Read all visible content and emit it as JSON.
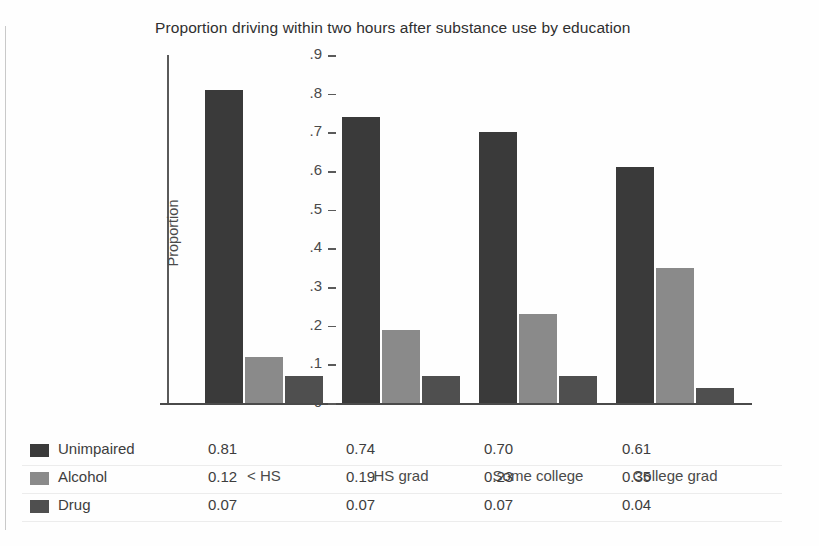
{
  "chart_data": {
    "type": "bar",
    "title": "Proportion driving within two hours after substance use by education",
    "xlabel": "",
    "ylabel": "Proportion",
    "ylim": [
      0,
      0.9
    ],
    "grid": false,
    "legend_position": "below-table",
    "categories": [
      "< HS",
      "HS grad",
      "Some college",
      "College grad"
    ],
    "ytick_labels": [
      "0",
      ".1",
      ".2",
      ".3",
      ".4",
      ".5",
      ".6",
      ".7",
      ".8",
      ".9"
    ],
    "ytick_values": [
      0,
      0.1,
      0.2,
      0.3,
      0.4,
      0.5,
      0.6,
      0.7,
      0.8,
      0.9
    ],
    "series": [
      {
        "name": "Unimpaired",
        "color": "#3a3a3a",
        "values": [
          0.81,
          0.74,
          0.7,
          0.61
        ],
        "labels": [
          "0.81",
          "0.74",
          "0.70",
          "0.61"
        ]
      },
      {
        "name": "Alcohol",
        "color": "#8a8a8a",
        "values": [
          0.12,
          0.19,
          0.23,
          0.35
        ],
        "labels": [
          "0.12",
          "0.19",
          "0.23",
          "0.35"
        ]
      },
      {
        "name": "Drug",
        "color": "#4f4f4f",
        "values": [
          0.07,
          0.07,
          0.07,
          0.04
        ],
        "labels": [
          "0.07",
          "0.07",
          "0.07",
          "0.04"
        ]
      }
    ]
  },
  "title": {
    "text": "Proportion driving within two hours after substance use by education"
  },
  "axes": {
    "y_title": "Proportion",
    "y_ticks": [
      ".9",
      ".8",
      ".7",
      ".6",
      ".5",
      ".4",
      ".3",
      ".2",
      ".1",
      "0"
    ],
    "x_ticks": [
      "< HS",
      "HS grad",
      "Some college",
      "College grad"
    ]
  },
  "legend": {
    "rows": [
      {
        "label": "Unimpaired",
        "color": "#3a3a3a",
        "values": [
          "0.81",
          "0.74",
          "0.70",
          "0.61"
        ]
      },
      {
        "label": "Alcohol",
        "color": "#8a8a8a",
        "values": [
          "0.12",
          "0.19",
          "0.23",
          "0.35"
        ]
      },
      {
        "label": "Drug",
        "color": "#4f4f4f",
        "values": [
          "0.07",
          "0.07",
          "0.07",
          "0.04"
        ]
      }
    ]
  },
  "colors": {
    "unimpaired": "#3a3a3a",
    "alcohol": "#8a8a8a",
    "drug": "#4f4f4f",
    "axis": "#4a4a4a",
    "background": "#ffffff"
  }
}
